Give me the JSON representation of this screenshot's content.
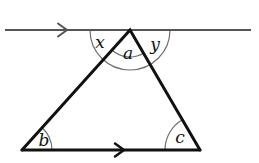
{
  "figure": {
    "type": "geometry-diagram",
    "background_color": "#ffffff"
  },
  "colors": {
    "triangle_stroke": "#111111",
    "parallel_line_stroke": "#555555",
    "arc_stroke": "#6e6e6e",
    "label_fill": "#111111"
  },
  "strokes": {
    "triangle_width": 3,
    "parallel_line_width": 2,
    "base_line_width": 3,
    "arc_width": 1.2,
    "arrow_width": 2
  },
  "points": {
    "apex": {
      "x": 130,
      "y": 30
    },
    "bottom_left": {
      "x": 22,
      "y": 150
    },
    "bottom_right": {
      "x": 200,
      "y": 150
    }
  },
  "top_line": {
    "name": "parallel-line-top",
    "x1": 5,
    "y1": 30,
    "x2": 251,
    "y2": 30,
    "arrow_marker": {
      "tip_x": 67,
      "tip_y": 30,
      "size": 9
    }
  },
  "base_line": {
    "name": "base-line",
    "arrow_marker": {
      "tip_x": 124,
      "tip_y": 150,
      "size": 9
    }
  },
  "arcs": {
    "apex_outer": {
      "cx": 130,
      "cy": 30,
      "r": 40,
      "start_deg": 180,
      "end_deg": 360
    },
    "apex_inner": {
      "cx": 130,
      "cy": 30,
      "r": 27
    },
    "angle_b": {
      "cx": 22,
      "cy": 150,
      "r": 30
    },
    "angle_c": {
      "cx": 200,
      "cy": 150,
      "r": 35
    }
  },
  "labels": [
    {
      "id": "x",
      "text": "x",
      "x": 100,
      "y": 48,
      "size": 17,
      "name": "angle-label-x"
    },
    {
      "id": "a",
      "text": "a",
      "x": 128,
      "y": 59,
      "size": 17,
      "name": "angle-label-a"
    },
    {
      "id": "y",
      "text": "y",
      "x": 155,
      "y": 50,
      "size": 17,
      "name": "angle-label-y"
    },
    {
      "id": "b",
      "text": "b",
      "x": 44,
      "y": 146,
      "size": 17,
      "name": "angle-label-b"
    },
    {
      "id": "c",
      "text": "c",
      "x": 180,
      "y": 143,
      "size": 17,
      "name": "angle-label-c"
    }
  ]
}
